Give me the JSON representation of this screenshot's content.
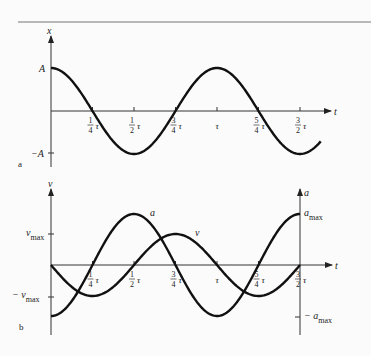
{
  "header": {
    "rule": true
  },
  "panel_a": {
    "letter": "a",
    "y_axis_label": "x",
    "x_axis_label": "t",
    "y_ticks": [
      {
        "label": "A"
      },
      {
        "label": "−A"
      }
    ],
    "x_ticks": [
      {
        "num": "1",
        "den": "4",
        "sym": "τ"
      },
      {
        "num": "1",
        "den": "2",
        "sym": "τ"
      },
      {
        "num": "3",
        "den": "4",
        "sym": "τ"
      },
      {
        "num": "",
        "den": "",
        "sym": "τ"
      },
      {
        "num": "5",
        "den": "4",
        "sym": "τ"
      },
      {
        "num": "3",
        "den": "2",
        "sym": "τ"
      }
    ]
  },
  "panel_b": {
    "letter": "b",
    "left_axis_label": "v",
    "right_axis_label": "a",
    "x_axis_label": "t",
    "curve_labels": {
      "a": "a",
      "v": "v"
    },
    "left_ticks": {
      "max_main": "v",
      "max_sub": "max",
      "min_prefix": "− v",
      "min_sub": "max"
    },
    "right_ticks": {
      "max_main": "a",
      "max_sub": "max",
      "min_prefix": "− a",
      "min_sub": "max"
    },
    "x_ticks": [
      {
        "num": "1",
        "den": "4",
        "sym": "τ"
      },
      {
        "num": "1",
        "den": "2",
        "sym": "τ"
      },
      {
        "num": "3",
        "den": "4",
        "sym": "τ"
      },
      {
        "num": "",
        "den": "",
        "sym": "τ"
      },
      {
        "num": "5",
        "den": "4",
        "sym": "τ"
      },
      {
        "num": "3",
        "den": "2",
        "sym": "τ"
      }
    ]
  },
  "chart_data": [
    {
      "type": "line",
      "title": "a",
      "xlabel": "t",
      "ylabel": "x",
      "x_ticks": [
        "1/4 τ",
        "1/2 τ",
        "3/4 τ",
        "τ",
        "5/4 τ",
        "3/2 τ"
      ],
      "y_ticks": [
        "A",
        "-A"
      ],
      "series": [
        {
          "name": "x",
          "function": "A cos(2πt/τ)",
          "x": [
            0,
            0.25,
            0.5,
            0.75,
            1,
            1.25,
            1.5,
            1.65
          ],
          "values": [
            1,
            0,
            -1,
            0,
            1,
            0,
            -1,
            -0.6
          ]
        }
      ]
    },
    {
      "type": "line",
      "title": "b",
      "xlabel": "t",
      "ylabel_left": "v",
      "ylabel_right": "a",
      "x_ticks": [
        "1/4 τ",
        "1/2 τ",
        "3/4 τ",
        "τ",
        "5/4 τ",
        "3/2 τ"
      ],
      "y_ticks_left": [
        "v_max",
        "-v_max"
      ],
      "y_ticks_right": [
        "a_max",
        "-a_max"
      ],
      "series": [
        {
          "name": "v",
          "function": "-v_max sin(2πt/τ)",
          "x": [
            0,
            0.25,
            0.5,
            0.75,
            1,
            1.25,
            1.5
          ],
          "values": [
            0,
            -1,
            0,
            1,
            0,
            -1,
            0
          ]
        },
        {
          "name": "a",
          "function": "-a_max cos(2πt/τ)",
          "x": [
            0,
            0.25,
            0.5,
            0.75,
            1,
            1.25,
            1.5
          ],
          "values": [
            -1,
            0,
            1,
            0,
            -1,
            0,
            1
          ]
        }
      ]
    }
  ]
}
